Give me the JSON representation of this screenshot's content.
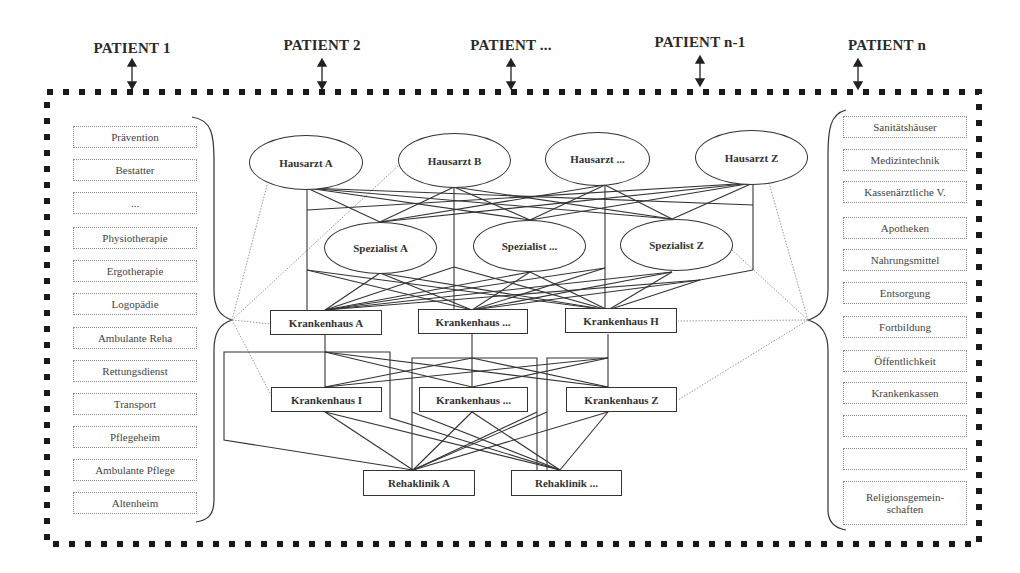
{
  "patients": [
    {
      "label": "PATIENT 1",
      "x": 132
    },
    {
      "label": "PATIENT 2",
      "x": 322
    },
    {
      "label": "PATIENT ...",
      "x": 511
    },
    {
      "label": "PATIENT n-1",
      "x": 700
    },
    {
      "label": "PATIENT n",
      "x": 858
    }
  ],
  "left_services": [
    "Prävention",
    "Bestatter",
    "...",
    "Physiotherapie",
    "Ergotherapie",
    "Logopädie",
    "Ambulante Reha",
    "Rettungsdienst",
    "Transport",
    "Pflegeheim",
    "Ambulante Pflege",
    "Altenheim"
  ],
  "right_services": [
    "Sanitätshäuser",
    "Medizintechnik",
    "Kassenärztliche V.",
    "Apotheken",
    "Nahrungsmittel",
    "Entsorgung",
    "Fortbildung",
    "Öffentlichkeit",
    "Krankenkassen",
    "",
    "",
    "Religionsgemein-\nschaften"
  ],
  "hausaerzte": [
    "Hausarzt A",
    "Hausarzt B",
    "Hausarzt ...",
    "Hausarzt Z"
  ],
  "spezialisten": [
    "Spezialist A",
    "Spezialist ...",
    "Spezialist Z"
  ],
  "krankenhaeuser_top": [
    "Krankenhaus A",
    "Krankenhaus ...",
    "Krankenhaus H"
  ],
  "krankenhaeuser_bottom": [
    "Krankenhaus I",
    "Krankenhaus ...",
    "Krankenhaus Z"
  ],
  "rehakliniken": [
    "Rehaklinik A",
    "Rehaklinik ..."
  ],
  "colors": {
    "border": "#1a1a1a",
    "line": "#333333",
    "dotted_line": "#9a9a9a",
    "box_border": "#8a8a8a"
  }
}
